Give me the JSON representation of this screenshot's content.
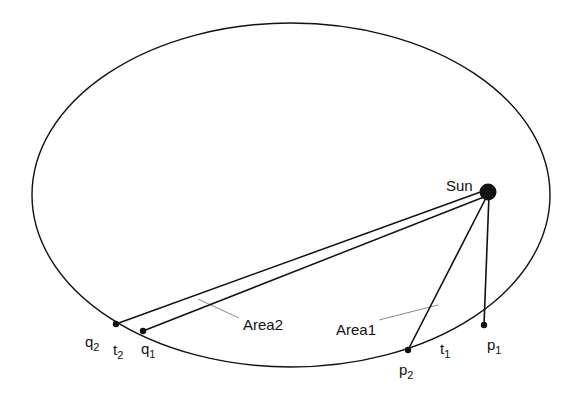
{
  "figure": {
    "title_visible": false,
    "background_color": "#ffffff",
    "stroke_color": "#111111",
    "leader_color": "#8a8a8a",
    "orbit": {
      "center_x": 291,
      "center_y": 195,
      "radius_x": 259,
      "radius_y": 172,
      "stroke_width": 1.4
    },
    "sun": {
      "label": "Sun",
      "x": 488,
      "y": 192,
      "dot_radius": 8.5,
      "label_x": 446,
      "label_y": 178
    },
    "points": [
      {
        "id": "p1",
        "label": "p",
        "subscript": "1",
        "x": 484,
        "y": 325,
        "label_x": 487,
        "label_y": 337,
        "dot_radius": 3.2
      },
      {
        "id": "p2",
        "label": "p",
        "subscript": "2",
        "x": 408,
        "y": 350,
        "label_x": 399,
        "label_y": 362,
        "dot_radius": 3.2
      },
      {
        "id": "q1",
        "label": "q",
        "subscript": "1",
        "x": 143,
        "y": 331,
        "label_x": 141,
        "label_y": 341,
        "dot_radius": 3.2
      },
      {
        "id": "q2",
        "label": "q",
        "subscript": "2",
        "x": 116,
        "y": 324,
        "label_x": 85,
        "label_y": 334,
        "dot_radius": 3.2
      }
    ],
    "arc_labels": [
      {
        "id": "t1",
        "label": "t",
        "subscript": "1",
        "x": 440,
        "y": 341
      },
      {
        "id": "t2",
        "label": "t",
        "subscript": "2",
        "x": 113,
        "y": 342
      }
    ],
    "areas": [
      {
        "id": "area1",
        "label": "Area1",
        "label_x": 336,
        "label_y": 322,
        "leader": {
          "x1": 379,
          "y1": 320,
          "x2": 438,
          "y2": 305
        }
      },
      {
        "id": "area2",
        "label": "Area2",
        "label_x": 243,
        "label_y": 317,
        "leader": {
          "x1": 239,
          "y1": 318,
          "x2": 198,
          "y2": 299
        }
      }
    ],
    "radius_lines": [
      {
        "id": "sun-to-p1",
        "x1": 488,
        "y1": 192,
        "x2": 484,
        "y2": 325
      },
      {
        "id": "sun-to-p2",
        "x1": 488,
        "y1": 192,
        "x2": 408,
        "y2": 350
      },
      {
        "id": "sun-to-q1",
        "x1": 488,
        "y1": 192,
        "x2": 143,
        "y2": 331
      },
      {
        "id": "sun-to-q2",
        "x1": 488,
        "y1": 192,
        "x2": 116,
        "y2": 324
      }
    ]
  }
}
